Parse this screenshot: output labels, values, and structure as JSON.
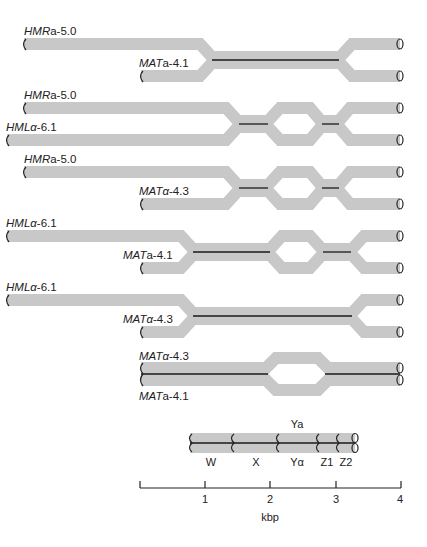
{
  "panels": [
    {
      "top_label": {
        "gene": "HMR",
        "allele": "a",
        "suffix": "-5.0"
      },
      "bottom_label": {
        "gene": "MAT",
        "allele": "a",
        "suffix": "-4.1"
      }
    },
    {
      "top_label": {
        "gene": "HMR",
        "allele": "a",
        "suffix": "-5.0"
      },
      "bottom_label": {
        "gene": "HML",
        "allele": "α",
        "suffix": "-6.1"
      }
    },
    {
      "top_label": {
        "gene": "HMR",
        "allele": "a",
        "suffix": "-5.0"
      },
      "bottom_label": {
        "gene": "MAT",
        "allele": "α",
        "suffix": "-4.3"
      }
    },
    {
      "top_label": {
        "gene": "HML",
        "allele": "α",
        "suffix": "-6.1"
      },
      "bottom_label": {
        "gene": "MAT",
        "allele": "a",
        "suffix": "-4.1"
      }
    },
    {
      "top_label": {
        "gene": "HML",
        "allele": "α",
        "suffix": "-6.1"
      },
      "bottom_label": {
        "gene": "MAT",
        "allele": "α",
        "suffix": "-4.3"
      }
    },
    {
      "top_label": {
        "gene": "MAT",
        "allele": "α",
        "suffix": "-4.3"
      },
      "bottom_label": {
        "gene": "MAT",
        "allele": "a",
        "suffix": "-4.1"
      }
    }
  ],
  "legend": {
    "regions": [
      "W",
      "X",
      "Yα",
      "Z1",
      "Z2"
    ],
    "ya_label": "Ya"
  },
  "axis": {
    "ticks": [
      "1",
      "2",
      "3",
      "4"
    ],
    "unit": "kbp"
  }
}
